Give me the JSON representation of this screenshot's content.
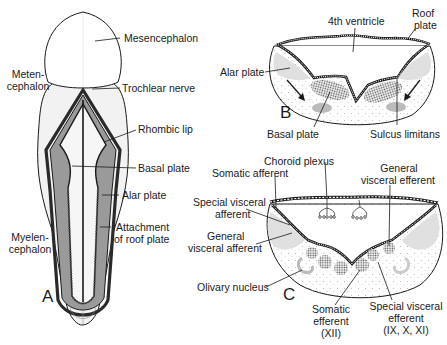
{
  "figure": {
    "panels": [
      {
        "id": "A",
        "letter": "A",
        "description": "Dorsal view of brainstem (rhombencephalon) with roof plate removed",
        "labels": {
          "mesencephalon": "Mesencephalon",
          "metencephalon_1": "Meten-",
          "metencephalon_2": "cephalon",
          "trochlear_nerve": "Trochlear nerve",
          "rhombic_lip": "Rhombic lip",
          "basal_plate": "Basal plate",
          "alar_plate": "Alar plate",
          "attachment_1": "Attachment",
          "attachment_2": "of roof plate",
          "myelencephalon_1": "Myelen-",
          "myelencephalon_2": "cephalon"
        }
      },
      {
        "id": "B",
        "letter": "B",
        "description": "Cross section of early myelencephalon",
        "labels": {
          "fourth_ventricle": "4th ventricle",
          "roof_plate_1": "Roof",
          "roof_plate_2": "plate",
          "alar_plate": "Alar plate",
          "basal_plate": "Basal plate",
          "sulcus_limitans": "Sulcus limitans"
        }
      },
      {
        "id": "C",
        "letter": "C",
        "description": "Cross section of later myelencephalon showing cranial nerve nuclei columns",
        "labels": {
          "choroid_plexus": "Choroid plexus",
          "somatic_afferent": "Somatic afferent",
          "gve_1": "General",
          "gve_2": "visceral efferent",
          "sva_1": "Special visceral",
          "sva_2": "afferent",
          "gva_1": "General",
          "gva_2": "visceral afferent",
          "olivary_nucleus": "Olivary nucleus",
          "se_1": "Somatic",
          "se_2": "efferent",
          "se_3": "(XII)",
          "sve_1": "Special visceral",
          "sve_2": "efferent",
          "sve_3": "(IX, X, XI)"
        }
      }
    ],
    "colors": {
      "ink": "#1a1a1a",
      "shade": "#9a9a9a",
      "light_shade": "#dcdcdc",
      "background": "#ffffff"
    }
  }
}
